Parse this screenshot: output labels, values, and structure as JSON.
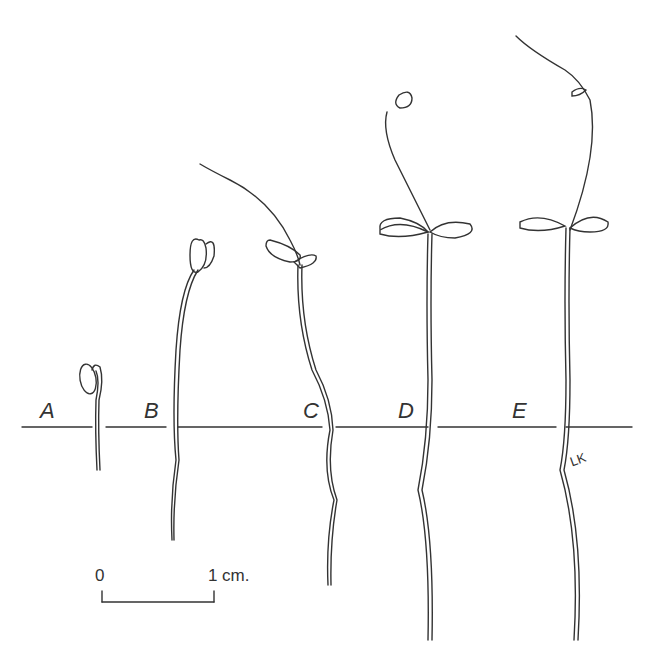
{
  "figure": {
    "stage_labels": [
      "A",
      "B",
      "C",
      "D",
      "E"
    ],
    "scale_bar": {
      "start_label": "0",
      "end_label": "1",
      "unit": "cm."
    },
    "signature": "LK",
    "colors": {
      "ink": "#333333",
      "background": "#ffffff"
    }
  }
}
